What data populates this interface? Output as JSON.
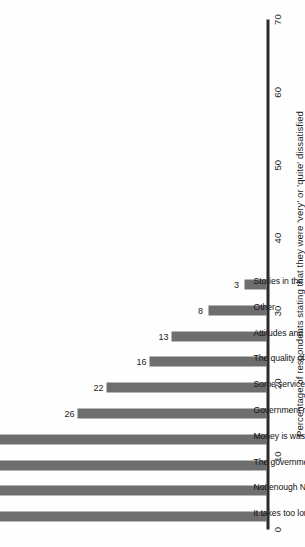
{
  "chart_data": {
    "type": "bar",
    "orientation": "vertical-rotated",
    "title": "",
    "xlabel": "Percentage of respondents stating that they were 'very' or 'quite' dissatisfied",
    "ylabel": "",
    "xlim": [
      0,
      70
    ],
    "grid": false,
    "legend": null,
    "tick_labels": [
      "0",
      "10",
      "20",
      "30",
      "40",
      "50",
      "60",
      "70"
    ],
    "ticks": [
      0,
      10,
      20,
      30,
      40,
      50,
      60,
      70
    ],
    "bar_color": "#6e6e6e",
    "axis_color": "#2b2b2b",
    "categories": [
      "It takes too long to get a GP or hospital appointment",
      "Not enough NHS staff",
      "The government doesn't spend enough money on the NHS",
      "Money is wasted in the NHS",
      "Government reforms that affect the NHS",
      "Some services or treatments are not available on the NHS",
      "The quality of NHS care",
      "Attitudes and behaviour of NHS staff",
      "Other",
      "Stories in the newspaper, on the radio or on TV"
    ],
    "values": [
      65,
      46,
      40,
      39,
      26,
      22,
      16,
      13,
      8,
      3
    ],
    "value_labels": [
      "65",
      "46",
      "40",
      "39",
      "26",
      "22",
      "16",
      "13",
      "8",
      "3"
    ]
  }
}
